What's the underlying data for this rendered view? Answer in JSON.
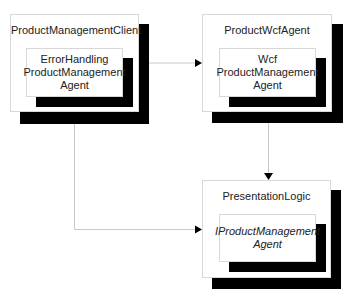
{
  "diagram": {
    "components": [
      {
        "id": "client",
        "title": "ProductManagementClient",
        "inner": {
          "lines": [
            "ErrorHandling",
            "ProductManagement",
            "Agent"
          ],
          "italic": false
        }
      },
      {
        "id": "wcf",
        "title": "ProductWcfAgent",
        "inner": {
          "lines": [
            "Wcf",
            "ProductManagement",
            "Agent"
          ],
          "italic": false
        }
      },
      {
        "id": "presentation",
        "title": "PresentationLogic",
        "inner": {
          "lines": [
            "IProductManagement",
            "Agent"
          ],
          "italic": true
        }
      }
    ],
    "connections": [
      {
        "from": "client",
        "to": "wcf",
        "style": "arrow"
      },
      {
        "from": "wcf",
        "to": "presentation",
        "style": "arrow"
      },
      {
        "from": "client",
        "to": "presentation",
        "style": "elbow-arrow"
      }
    ],
    "colors": {
      "shadow": "#000000",
      "line": "#c8c8c8",
      "arrowhead": "#000000",
      "border": "#d8d8d8"
    }
  }
}
